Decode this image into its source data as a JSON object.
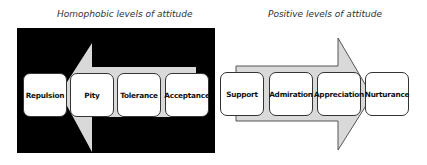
{
  "left_panel": {
    "title": "Homophobic levels of attitude",
    "direction": "left",
    "background": "#000000",
    "arrow_fill": "#d9d9d9",
    "levels": [
      {
        "label": "Repulsion"
      },
      {
        "label": "Pity"
      },
      {
        "label": "Tolerance"
      },
      {
        "label": "Acceptance"
      }
    ]
  },
  "right_panel": {
    "title": "Positive levels of attitude",
    "direction": "right",
    "background": "#ffffff",
    "arrow_fill": "#d9d9d9",
    "levels": [
      {
        "label": "Support"
      },
      {
        "label": "Admiration"
      },
      {
        "label": "Appreciation"
      },
      {
        "label": "Nurturance"
      }
    ]
  }
}
